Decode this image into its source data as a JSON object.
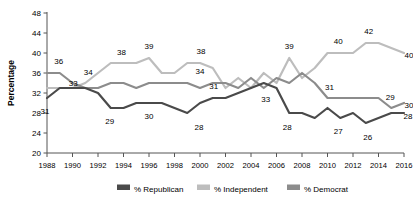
{
  "chart_data": {
    "type": "line",
    "title": "",
    "xlabel": "",
    "ylabel": "Percentage",
    "ylim": [
      20,
      48
    ],
    "ytick_step": 4,
    "yticks": [
      20,
      24,
      28,
      32,
      36,
      40,
      44,
      48
    ],
    "xlim": [
      1988,
      2016
    ],
    "xticks": [
      1988,
      1990,
      1992,
      1994,
      1996,
      1998,
      2000,
      2002,
      2004,
      2006,
      2008,
      2010,
      2012,
      2014,
      2016
    ],
    "grid": false,
    "legend_position": "bottom",
    "x": [
      1988,
      1989,
      1990,
      1991,
      1992,
      1993,
      1994,
      1995,
      1996,
      1997,
      1998,
      1999,
      2000,
      2001,
      2002,
      2003,
      2004,
      2005,
      2006,
      2007,
      2008,
      2009,
      2010,
      2011,
      2012,
      2013,
      2014,
      2015,
      2016
    ],
    "series": [
      {
        "name": "% Republican",
        "color": "#4a4a4a",
        "values": [
          31,
          33,
          33,
          33,
          32,
          29,
          29,
          30,
          30,
          30,
          29,
          28,
          30,
          31,
          31,
          32,
          33,
          34,
          33,
          28,
          28,
          27,
          29,
          27,
          28,
          26,
          27,
          28,
          28
        ]
      },
      {
        "name": "% Independent",
        "color": "#bdbdbd",
        "values": [
          33,
          33,
          33,
          34,
          36,
          38,
          38,
          38,
          39,
          36,
          36,
          38,
          38,
          37,
          33,
          35,
          33,
          36,
          34,
          39,
          35,
          37,
          40,
          40,
          40,
          42,
          42,
          41,
          40
        ]
      },
      {
        "name": "% Democrat",
        "color": "#8c8c8c",
        "values": [
          36,
          36,
          34,
          33,
          33,
          34,
          34,
          33,
          34,
          34,
          34,
          34,
          33,
          34,
          34,
          33,
          35,
          33,
          35,
          34,
          36,
          34,
          31,
          31,
          31,
          31,
          31,
          29,
          30
        ]
      }
    ],
    "annotations": [
      {
        "text": "31",
        "x": 1988,
        "value": 31,
        "series": "% Republican",
        "dx": -2,
        "dy": 16
      },
      {
        "text": "29",
        "x": 1993,
        "value": 29,
        "series": "% Republican",
        "dx": -1,
        "dy": 16
      },
      {
        "text": "30",
        "x": 1996,
        "value": 30,
        "series": "% Republican",
        "dx": 0,
        "dy": 16
      },
      {
        "text": "34",
        "x": 1991,
        "value": 34,
        "series": "% Republican",
        "dx": 3,
        "dy": -8
      },
      {
        "text": "34",
        "x": 2000,
        "value": 34,
        "series": "% Republican",
        "dx": 0,
        "dy": -9
      },
      {
        "text": "28",
        "x": 2000,
        "value": 28,
        "series": "% Republican",
        "dx": -1,
        "dy": 17
      },
      {
        "text": "33",
        "x": 2005,
        "value": 33,
        "series": "% Republican",
        "dx": 2,
        "dy": 14
      },
      {
        "text": "28",
        "x": 2007,
        "value": 28,
        "series": "% Republican",
        "dx": -2,
        "dy": 17
      },
      {
        "text": "27",
        "x": 2011,
        "value": 27,
        "series": "% Republican",
        "dx": -2,
        "dy": 16
      },
      {
        "text": "26",
        "x": 2013,
        "value": 26,
        "series": "% Republican",
        "dx": 2,
        "dy": 17
      },
      {
        "text": "28",
        "x": 2016,
        "value": 28,
        "series": "% Republican",
        "dx": 4,
        "dy": 6
      },
      {
        "text": "38",
        "x": 1994,
        "value": 38,
        "series": "% Independent",
        "dx": -2,
        "dy": -8
      },
      {
        "text": "39",
        "x": 1996,
        "value": 39,
        "series": "% Independent",
        "dx": 0,
        "dy": -9
      },
      {
        "text": "38",
        "x": 2000,
        "value": 38,
        "series": "% Independent",
        "dx": 1,
        "dy": -9
      },
      {
        "text": "39",
        "x": 2007,
        "value": 39,
        "series": "% Independent",
        "dx": 0,
        "dy": -9
      },
      {
        "text": "40",
        "x": 2011,
        "value": 40,
        "series": "% Independent",
        "dx": -2,
        "dy": -9
      },
      {
        "text": "42",
        "x": 2013,
        "value": 42,
        "series": "% Independent",
        "dx": 3,
        "dy": -9
      },
      {
        "text": "40",
        "x": 2016,
        "value": 40,
        "series": "% Independent",
        "dx": 5,
        "dy": 5
      },
      {
        "text": "36",
        "x": 1989,
        "value": 36,
        "series": "% Democrat",
        "dx": -1,
        "dy": -9
      },
      {
        "text": "33",
        "x": 1991,
        "value": 33,
        "series": "% Democrat",
        "dx": -12,
        "dy": -2
      },
      {
        "text": "31",
        "x": 2001,
        "value": 31,
        "series": "% Democrat",
        "dx": 1,
        "dy": -9
      },
      {
        "text": "31",
        "x": 2010,
        "value": 31,
        "series": "% Democrat",
        "dx": 2,
        "dy": -8
      },
      {
        "text": "29",
        "x": 2015,
        "value": 29,
        "series": "% Democrat",
        "dx": -1,
        "dy": -8
      },
      {
        "text": "30",
        "x": 2016,
        "value": 30,
        "series": "% Democrat",
        "dx": 5,
        "dy": 5
      }
    ]
  },
  "axis": {
    "ylabel": "Percentage",
    "ytick_labels": [
      "48",
      "44",
      "40",
      "36",
      "32",
      "28",
      "24",
      "20"
    ],
    "xtick_labels": [
      "1988",
      "1990",
      "1992",
      "1994",
      "1996",
      "1998",
      "2000",
      "2002",
      "2004",
      "2006",
      "2008",
      "2010",
      "2012",
      "2014",
      "2016"
    ]
  },
  "legend": {
    "items": [
      {
        "label": "% Republican",
        "color": "#4a4a4a"
      },
      {
        "label": "% Independent",
        "color": "#bdbdbd"
      },
      {
        "label": "% Democrat",
        "color": "#8c8c8c"
      }
    ]
  }
}
